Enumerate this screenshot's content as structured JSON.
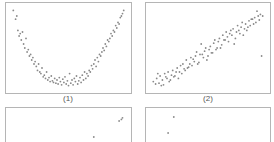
{
  "chart_data": [
    {
      "type": "scatter",
      "title": "",
      "label": "(1)",
      "xlabel": "",
      "ylabel": "",
      "grid": false,
      "pattern": "U-shaped (quadratic)",
      "x": [
        0.02,
        0.04,
        0.05,
        0.06,
        0.07,
        0.08,
        0.09,
        0.1,
        0.11,
        0.12,
        0.13,
        0.14,
        0.15,
        0.16,
        0.17,
        0.18,
        0.19,
        0.2,
        0.21,
        0.22,
        0.23,
        0.24,
        0.25,
        0.26,
        0.27,
        0.28,
        0.29,
        0.3,
        0.31,
        0.32,
        0.33,
        0.34,
        0.35,
        0.36,
        0.37,
        0.38,
        0.39,
        0.4,
        0.41,
        0.42,
        0.43,
        0.44,
        0.45,
        0.46,
        0.47,
        0.48,
        0.49,
        0.5,
        0.51,
        0.52,
        0.53,
        0.54,
        0.55,
        0.56,
        0.57,
        0.58,
        0.59,
        0.6,
        0.61,
        0.62,
        0.63,
        0.64,
        0.65,
        0.66,
        0.67,
        0.68,
        0.69,
        0.7,
        0.71,
        0.72,
        0.73,
        0.74,
        0.75,
        0.76,
        0.77,
        0.78,
        0.79,
        0.8,
        0.81,
        0.82,
        0.83,
        0.84,
        0.85,
        0.86,
        0.87,
        0.88,
        0.89,
        0.9,
        0.91,
        0.92,
        0.93,
        0.94,
        0.95,
        0.96,
        0.97,
        0.98
      ],
      "y": [
        0.97,
        0.86,
        0.9,
        0.72,
        0.65,
        0.68,
        0.6,
        0.7,
        0.55,
        0.5,
        0.62,
        0.45,
        0.48,
        0.4,
        0.42,
        0.35,
        0.38,
        0.3,
        0.33,
        0.27,
        0.22,
        0.3,
        0.2,
        0.18,
        0.25,
        0.14,
        0.16,
        0.12,
        0.2,
        0.1,
        0.13,
        0.08,
        0.15,
        0.09,
        0.07,
        0.12,
        0.06,
        0.1,
        0.05,
        0.13,
        0.08,
        0.04,
        0.11,
        0.07,
        0.14,
        0.05,
        0.09,
        0.03,
        0.18,
        0.06,
        0.1,
        0.04,
        0.12,
        0.08,
        0.15,
        0.05,
        0.09,
        0.13,
        0.07,
        0.16,
        0.1,
        0.2,
        0.12,
        0.18,
        0.15,
        0.22,
        0.2,
        0.28,
        0.24,
        0.3,
        0.35,
        0.27,
        0.38,
        0.33,
        0.42,
        0.4,
        0.45,
        0.5,
        0.47,
        0.55,
        0.52,
        0.6,
        0.58,
        0.62,
        0.68,
        0.65,
        0.72,
        0.7,
        0.78,
        0.75,
        0.82,
        0.8,
        0.88,
        0.9,
        0.93,
        0.97
      ]
    },
    {
      "type": "scatter",
      "title": "",
      "label": "(2)",
      "xlabel": "",
      "ylabel": "",
      "grid": false,
      "pattern": "positive linear",
      "x": [
        0.02,
        0.04,
        0.05,
        0.07,
        0.08,
        0.1,
        0.11,
        0.12,
        0.14,
        0.15,
        0.16,
        0.18,
        0.19,
        0.2,
        0.22,
        0.23,
        0.24,
        0.26,
        0.27,
        0.28,
        0.3,
        0.31,
        0.32,
        0.34,
        0.35,
        0.36,
        0.38,
        0.39,
        0.4,
        0.42,
        0.43,
        0.44,
        0.46,
        0.47,
        0.48,
        0.5,
        0.51,
        0.52,
        0.54,
        0.55,
        0.56,
        0.58,
        0.59,
        0.6,
        0.62,
        0.63,
        0.64,
        0.66,
        0.67,
        0.68,
        0.7,
        0.71,
        0.72,
        0.74,
        0.75,
        0.76,
        0.78,
        0.79,
        0.8,
        0.82,
        0.83,
        0.84,
        0.86,
        0.87,
        0.88,
        0.9,
        0.91,
        0.92,
        0.94,
        0.95,
        0.96,
        0.98,
        0.97,
        0.93,
        0.89,
        0.85,
        0.81,
        0.77,
        0.73,
        0.69,
        0.65,
        0.61,
        0.57,
        0.53,
        0.49,
        0.45,
        0.41,
        0.37,
        0.33,
        0.29,
        0.25,
        0.21,
        0.17,
        0.13,
        0.09,
        0.06
      ],
      "y": [
        0.08,
        0.05,
        0.12,
        0.06,
        0.15,
        0.1,
        0.04,
        0.18,
        0.12,
        0.2,
        0.08,
        0.16,
        0.22,
        0.14,
        0.2,
        0.25,
        0.12,
        0.28,
        0.18,
        0.3,
        0.22,
        0.35,
        0.25,
        0.3,
        0.38,
        0.28,
        0.33,
        0.4,
        0.45,
        0.32,
        0.42,
        0.55,
        0.38,
        0.46,
        0.5,
        0.4,
        0.48,
        0.52,
        0.44,
        0.56,
        0.6,
        0.5,
        0.58,
        0.62,
        0.54,
        0.66,
        0.6,
        0.7,
        0.64,
        0.58,
        0.72,
        0.66,
        0.74,
        0.62,
        0.7,
        0.78,
        0.68,
        0.76,
        0.82,
        0.74,
        0.8,
        0.72,
        0.84,
        0.78,
        0.86,
        0.8,
        0.88,
        0.82,
        0.9,
        0.85,
        0.92,
        0.9,
        0.4,
        0.96,
        0.86,
        0.76,
        0.66,
        0.72,
        0.55,
        0.68,
        0.6,
        0.5,
        0.48,
        0.44,
        0.35,
        0.42,
        0.3,
        0.36,
        0.26,
        0.24,
        0.2,
        0.15,
        0.1,
        0.14,
        0.03,
        0.18
      ]
    },
    {
      "type": "scatter",
      "title": "",
      "label": "(3)",
      "xlabel": "",
      "ylabel": "",
      "grid": false,
      "pattern": "weak positive (partially visible)",
      "x": [
        0.3,
        0.35,
        0.5,
        0.52,
        0.62,
        0.66,
        0.7,
        0.75,
        0.8,
        0.82,
        0.86,
        0.9,
        0.92,
        0.94,
        0.96,
        0.97,
        0.72,
        0.58,
        0.45,
        0.88
      ],
      "y": [
        0.4,
        0.48,
        0.45,
        0.5,
        0.52,
        0.46,
        0.5,
        0.44,
        0.55,
        0.58,
        0.62,
        0.5,
        0.55,
        0.9,
        0.92,
        0.94,
        0.7,
        0.3,
        0.25,
        0.42
      ]
    },
    {
      "type": "scatter",
      "title": "",
      "label": "(4)",
      "xlabel": "",
      "ylabel": "",
      "grid": false,
      "pattern": "negative (partially visible)",
      "x": [
        0.2,
        0.15,
        0.18,
        0.22,
        0.25,
        0.28,
        0.3,
        0.35,
        0.38,
        0.4,
        0.42,
        0.45,
        0.5,
        0.55,
        0.6,
        0.7,
        0.8,
        0.9,
        0.12,
        0.32,
        0.48,
        0.65
      ],
      "y": [
        0.95,
        0.75,
        0.5,
        0.45,
        0.4,
        0.42,
        0.38,
        0.6,
        0.55,
        0.45,
        0.35,
        0.4,
        0.3,
        0.45,
        0.2,
        0.25,
        0.2,
        0.15,
        0.35,
        0.5,
        0.3,
        0.18
      ]
    }
  ],
  "panels": [
    {
      "label": "(1)"
    },
    {
      "label": "(2)"
    },
    {
      "label": "(3)"
    },
    {
      "label": "(4)"
    }
  ],
  "colors": {
    "point": "#8a8a8a",
    "border": "#b5b5b5"
  }
}
